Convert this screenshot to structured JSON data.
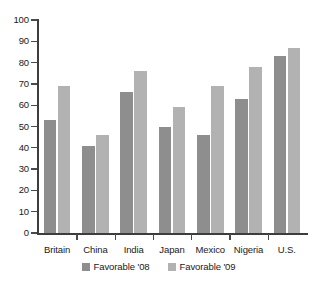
{
  "chart_data": {
    "type": "bar",
    "title": "",
    "subtitle": "",
    "xlabel": "",
    "ylabel": "",
    "ylim": [
      0,
      100
    ],
    "ytick_step": 10,
    "yticks": [
      0,
      10,
      20,
      30,
      40,
      50,
      60,
      70,
      80,
      90,
      100
    ],
    "grid": false,
    "legend_position": "bottom-center",
    "categories": [
      "Britain",
      "China",
      "India",
      "Japan",
      "Mexico",
      "Nigeria",
      "U.S."
    ],
    "series": [
      {
        "name": "Favorable '08",
        "color": "#8e8e8e",
        "values": [
          53,
          41,
          66,
          50,
          46,
          63,
          83
        ]
      },
      {
        "name": "Favorable '09",
        "color": "#b2b2b2",
        "values": [
          69,
          46,
          76,
          59,
          69,
          78,
          87
        ]
      }
    ]
  },
  "legend": {
    "items": [
      {
        "label": "Favorable '08",
        "color": "#8e8e8e"
      },
      {
        "label": "Favorable '09",
        "color": "#b2b2b2"
      }
    ]
  },
  "axes": {
    "y": {
      "labels": [
        "100",
        "90",
        "80",
        "70",
        "60",
        "50",
        "40",
        "30",
        "20",
        "10",
        "0"
      ]
    },
    "x": {
      "labels": [
        "Britain",
        "China",
        "India",
        "Japan",
        "Mexico",
        "Nigeria",
        "U.S."
      ]
    }
  },
  "colors": {
    "axis": "#3d3d3d",
    "tick": "#4a4a4a",
    "text": "#1a1a1a",
    "background": "#ffffff",
    "series_08": "#8e8e8e",
    "series_09": "#b2b2b2"
  }
}
